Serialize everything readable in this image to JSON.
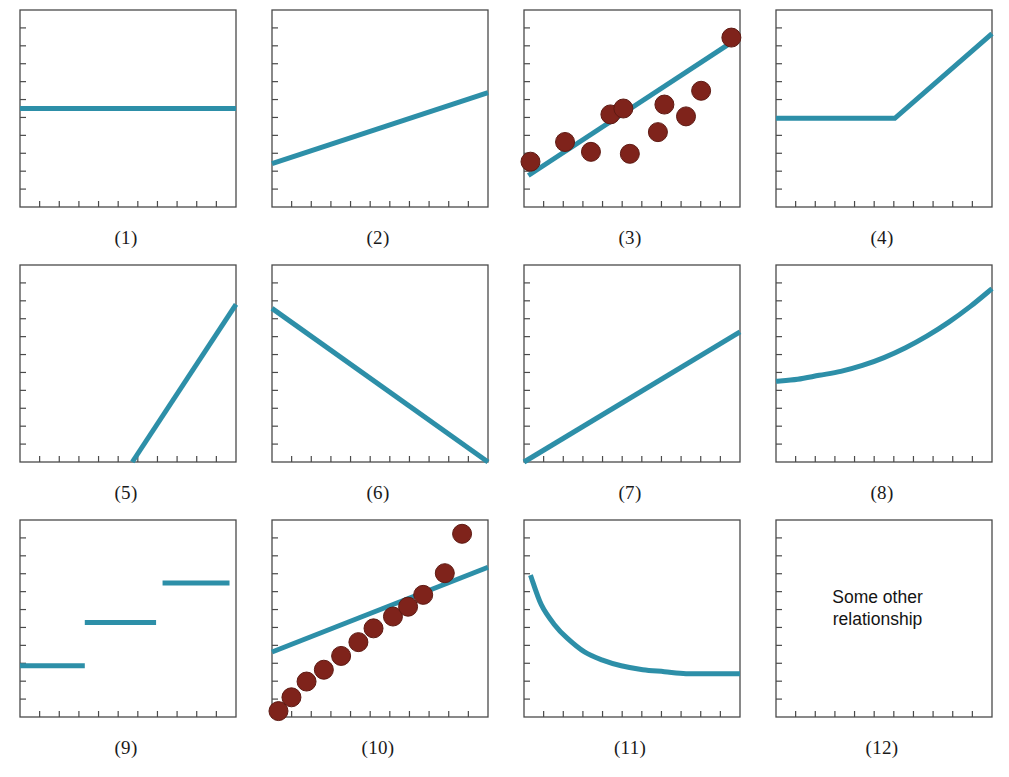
{
  "figure": {
    "panel_count": 12,
    "columns": 4,
    "rows": 3,
    "background_color": "#ffffff"
  },
  "style": {
    "line_color": "#2d8fa8",
    "point_color": "#7f231b",
    "point_edge_color": "#5e1a13",
    "axis_color": "#4a4a4a",
    "text_color": "#141414",
    "line_width": 5.0,
    "point_radius": 9.5,
    "tick_count_x": 10,
    "tick_count_y": 10,
    "tick_length": 6
  },
  "chart_data": [
    {
      "id": 1,
      "type": "line",
      "caption": "(1)",
      "description": "No relationship — flat horizontal line",
      "title": "",
      "xlabel": "",
      "ylabel": "",
      "xlim": [
        0,
        100
      ],
      "ylim": [
        0,
        100
      ],
      "grid": false,
      "series": [
        {
          "name": "flat",
          "kind": "line",
          "x": [
            0,
            100
          ],
          "values": [
            50,
            50
          ]
        }
      ]
    },
    {
      "id": 2,
      "type": "line",
      "caption": "(2)",
      "description": "Weak positive linear relationship",
      "title": "",
      "xlabel": "",
      "ylabel": "",
      "xlim": [
        0,
        100
      ],
      "ylim": [
        0,
        100
      ],
      "grid": false,
      "series": [
        {
          "name": "positive-linear",
          "kind": "line",
          "x": [
            0,
            100
          ],
          "values": [
            22,
            58
          ]
        }
      ]
    },
    {
      "id": 3,
      "type": "scatter",
      "caption": "(3)",
      "description": "Positive linear relationship with scattered data points",
      "title": "",
      "xlabel": "",
      "ylabel": "",
      "xlim": [
        0,
        100
      ],
      "ylim": [
        0,
        100
      ],
      "grid": false,
      "series": [
        {
          "name": "fit-line",
          "kind": "line",
          "x": [
            2,
            98
          ],
          "values": [
            16,
            85
          ]
        },
        {
          "name": "observations",
          "kind": "scatter",
          "x": [
            3,
            19,
            31,
            40,
            46,
            49,
            62,
            65,
            75,
            82,
            96
          ],
          "values": [
            23,
            33,
            28,
            47,
            50,
            27,
            38,
            52,
            46,
            59,
            86
          ]
        }
      ]
    },
    {
      "id": 4,
      "type": "line",
      "caption": "(4)",
      "description": "Threshold / hockey-stick relationship — flat then rising",
      "title": "",
      "xlabel": "",
      "ylabel": "",
      "xlim": [
        0,
        100
      ],
      "ylim": [
        0,
        100
      ],
      "grid": false,
      "series": [
        {
          "name": "hockey-stick",
          "kind": "line",
          "x": [
            0,
            55,
            100
          ],
          "values": [
            45,
            45,
            88
          ]
        }
      ]
    },
    {
      "id": 5,
      "type": "line",
      "caption": "(5)",
      "description": "No effect until a threshold, then a steep rise",
      "title": "",
      "xlabel": "",
      "ylabel": "",
      "xlim": [
        0,
        100
      ],
      "ylim": [
        0,
        100
      ],
      "grid": false,
      "series": [
        {
          "name": "steep-rise",
          "kind": "line",
          "x": [
            52,
            100
          ],
          "values": [
            0,
            80
          ]
        }
      ]
    },
    {
      "id": 6,
      "type": "line",
      "caption": "(6)",
      "description": "Negative linear relationship",
      "title": "",
      "xlabel": "",
      "ylabel": "",
      "xlim": [
        0,
        100
      ],
      "ylim": [
        0,
        100
      ],
      "grid": false,
      "series": [
        {
          "name": "negative-linear",
          "kind": "line",
          "x": [
            0,
            100
          ],
          "values": [
            78,
            0
          ]
        }
      ]
    },
    {
      "id": 7,
      "type": "line",
      "caption": "(7)",
      "description": "Positive linear relationship through the origin",
      "title": "",
      "xlabel": "",
      "ylabel": "",
      "xlim": [
        0,
        100
      ],
      "ylim": [
        0,
        100
      ],
      "grid": false,
      "series": [
        {
          "name": "through-origin",
          "kind": "line",
          "x": [
            0,
            100
          ],
          "values": [
            0,
            66
          ]
        }
      ]
    },
    {
      "id": 8,
      "type": "line",
      "caption": "(8)",
      "description": "Exponential / accelerating increase",
      "title": "",
      "xlabel": "",
      "ylabel": "",
      "xlim": [
        0,
        100
      ],
      "ylim": [
        0,
        100
      ],
      "grid": false,
      "series": [
        {
          "name": "exponential",
          "kind": "curve",
          "x": [
            0,
            10,
            20,
            30,
            40,
            50,
            60,
            70,
            80,
            90,
            100
          ],
          "values": [
            41,
            42,
            44,
            46,
            49,
            53,
            58,
            64,
            71,
            79,
            88
          ]
        }
      ]
    },
    {
      "id": 9,
      "type": "line",
      "caption": "(9)",
      "description": "Step function — three discrete plateau levels",
      "title": "",
      "xlabel": "",
      "ylabel": "",
      "xlim": [
        0,
        100
      ],
      "ylim": [
        0,
        100
      ],
      "grid": false,
      "series": [
        {
          "name": "step-low",
          "kind": "segment",
          "x": [
            0,
            30
          ],
          "values": [
            26,
            26
          ]
        },
        {
          "name": "step-mid",
          "kind": "segment",
          "x": [
            30,
            63
          ],
          "values": [
            48,
            48
          ]
        },
        {
          "name": "step-high",
          "kind": "segment",
          "x": [
            66,
            97
          ],
          "values": [
            68,
            68
          ]
        }
      ]
    },
    {
      "id": 10,
      "type": "scatter",
      "caption": "(10)",
      "description": "Curved (nonlinear) data poorly summarised by a straight line",
      "title": "",
      "xlabel": "",
      "ylabel": "",
      "xlim": [
        0,
        100
      ],
      "ylim": [
        0,
        100
      ],
      "grid": false,
      "series": [
        {
          "name": "fit-line",
          "kind": "line",
          "x": [
            0,
            100
          ],
          "values": [
            33,
            76
          ]
        },
        {
          "name": "observations",
          "kind": "scatter",
          "x": [
            3,
            9,
            16,
            24,
            32,
            40,
            47,
            56,
            63,
            70,
            80,
            88
          ],
          "values": [
            3,
            10,
            18,
            24,
            31,
            38,
            45,
            51,
            56,
            62,
            73,
            93
          ]
        }
      ]
    },
    {
      "id": 11,
      "type": "line",
      "caption": "(11)",
      "description": "Decaying curve approaching an asymptote",
      "title": "",
      "xlabel": "",
      "ylabel": "",
      "xlim": [
        0,
        100
      ],
      "ylim": [
        0,
        100
      ],
      "grid": false,
      "series": [
        {
          "name": "decay",
          "kind": "curve",
          "x": [
            3,
            8,
            14,
            20,
            28,
            36,
            45,
            55,
            65,
            75,
            85,
            100
          ],
          "values": [
            72,
            57,
            47,
            40,
            33,
            29,
            26,
            24,
            23,
            22,
            22,
            22
          ]
        }
      ]
    },
    {
      "id": 12,
      "type": "line",
      "caption": "(12)",
      "description": "Some other relationship — annotation only, no data drawn",
      "title": "",
      "xlabel": "",
      "ylabel": "",
      "xlim": [
        0,
        100
      ],
      "ylim": [
        0,
        100
      ],
      "grid": false,
      "series": [],
      "annotation": {
        "line1": "Some other",
        "line2": "relationship",
        "x": 47,
        "y": 58
      }
    }
  ],
  "captions": {
    "p1": "(1)",
    "p2": "(2)",
    "p3": "(3)",
    "p4": "(4)",
    "p5": "(5)",
    "p6": "(6)",
    "p7": "(7)",
    "p8": "(8)",
    "p9": "(9)",
    "p10": "(10)",
    "p11": "(11)",
    "p12": "(12)"
  },
  "annotation_text": {
    "line1": "Some other",
    "line2": "relationship"
  }
}
